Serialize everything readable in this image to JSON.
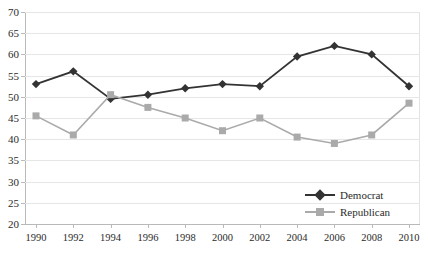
{
  "chart_data": {
    "type": "line",
    "title": "",
    "subtitle": "",
    "xlabel": "",
    "ylabel": "",
    "categories": [
      1990,
      1992,
      1994,
      1996,
      1998,
      2000,
      2002,
      2004,
      2006,
      2008,
      2010
    ],
    "xtick_labels": [
      "1990",
      "1992",
      "1994",
      "1996",
      "1998",
      "2000",
      "2002",
      "2004",
      "2006",
      "2008",
      "2010"
    ],
    "ytick_labels": [
      "70",
      "65",
      "60",
      "55",
      "50",
      "45",
      "40",
      "35",
      "30",
      "25",
      "20"
    ],
    "ylim": [
      20,
      70
    ],
    "ytick_step": 5,
    "xlim": [
      1990,
      2010
    ],
    "xtick_step": 2,
    "grid": true,
    "legend_position": "bottom-right-inside",
    "series": [
      {
        "name": "Democrat",
        "color": "#333333",
        "marker": "diamond",
        "values": [
          53,
          56,
          49.5,
          50.5,
          52,
          53,
          52.5,
          59.5,
          62,
          60,
          52.5
        ]
      },
      {
        "name": "Republican",
        "color": "#aaaaaa",
        "marker": "square",
        "values": [
          45.5,
          41,
          50.5,
          47.5,
          45,
          42,
          45,
          40.5,
          39,
          41,
          48.5
        ]
      }
    ]
  },
  "colors": {
    "background": "#ffffff",
    "gridline": "#e6e6e6",
    "axis": "#b9b9b9",
    "text": "#2b2b2b",
    "democrat": "#333333",
    "republican": "#aaaaaa"
  }
}
